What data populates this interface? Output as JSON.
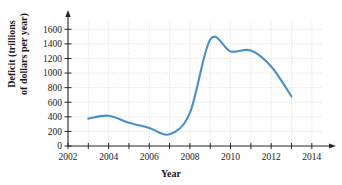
{
  "chart_data": {
    "type": "line",
    "title": "",
    "xlabel": "Year",
    "ylabel_line1": "Deficit (trillions",
    "ylabel_line2": "of dollars per year)",
    "x": [
      2003,
      2004,
      2005,
      2006,
      2007,
      2008,
      2009,
      2010,
      2011,
      2012,
      2013
    ],
    "values": [
      375,
      415,
      318,
      248,
      160,
      455,
      1460,
      1295,
      1310,
      1090,
      680
    ],
    "series": [
      {
        "name": "Deficit",
        "color": "#4B8FC7",
        "values": [
          375,
          415,
          318,
          248,
          160,
          455,
          1460,
          1295,
          1310,
          1090,
          680
        ]
      }
    ],
    "xlim": [
      2002,
      2014.5
    ],
    "ylim": [
      0,
      1700
    ],
    "xticks": [
      2002,
      2004,
      2006,
      2008,
      2010,
      2012,
      2014
    ],
    "xtick_labels": [
      "2002",
      "2004",
      "2006",
      "2008",
      "2010",
      "2012",
      "2014"
    ],
    "xminorticks": [
      2003,
      2005,
      2007,
      2009,
      2011,
      2013
    ],
    "yticks": [
      0,
      200,
      400,
      600,
      800,
      1000,
      1200,
      1400,
      1600
    ],
    "ytick_labels": [
      "0",
      "200",
      "400",
      "600",
      "800",
      "1000",
      "1200",
      "1400",
      "1600"
    ],
    "grid": true,
    "grid_style": "dotted",
    "grid_color": "#c8c8c8",
    "legend": "none",
    "axis_color": "#262626",
    "axis_arrows": true
  }
}
